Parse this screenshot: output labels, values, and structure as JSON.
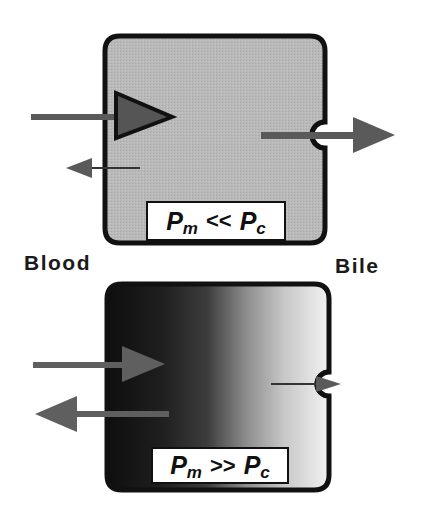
{
  "labels": {
    "left_side": "Blood",
    "right_side": "Bile"
  },
  "panels": [
    {
      "id": "top",
      "condition": {
        "p1": "P",
        "p1_sub": "m",
        "operator": "<<",
        "p2": "P",
        "p2_sub": "c"
      },
      "fill": "uniform-gray",
      "uptake_arrow": "large",
      "efflux_to_blood_arrow": "small",
      "efflux_to_bile_arrow": "large"
    },
    {
      "id": "bottom",
      "condition": {
        "p1": "P",
        "p1_sub": "m",
        "operator": ">>",
        "p2": "P",
        "p2_sub": "c"
      },
      "fill": "gradient-dark-to-light",
      "uptake_arrow": "medium",
      "efflux_to_blood_arrow": "large",
      "efflux_to_bile_arrow": "small"
    }
  ],
  "colors": {
    "outline": "#111111",
    "arrow": "#5a5a5a",
    "top_fill": "#b8b8b8",
    "gradient_dark": "#0e0e0e",
    "gradient_mid": "#7a7a7a",
    "gradient_light": "#efefef",
    "label_bg": "#ffffff"
  }
}
